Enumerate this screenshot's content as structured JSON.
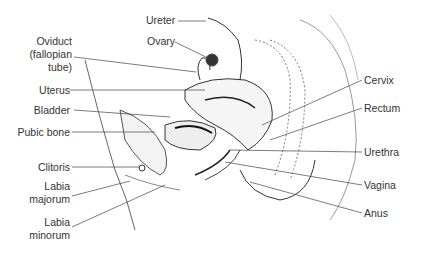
{
  "diagram": {
    "labels_left": [
      {
        "id": "oviduct",
        "text": "Oviduct\n(fallopian\ntube)"
      },
      {
        "id": "uterus",
        "text": "Uterus"
      },
      {
        "id": "bladder",
        "text": "Bladder"
      },
      {
        "id": "pubic-bone",
        "text": "Pubic bone"
      },
      {
        "id": "clitoris",
        "text": "Clitoris"
      },
      {
        "id": "labia-majorum",
        "text": "Labia\nmajorum"
      },
      {
        "id": "labia-minorum",
        "text": "Labia\nminorum"
      }
    ],
    "labels_top": [
      {
        "id": "ureter",
        "text": "Ureter"
      },
      {
        "id": "ovary",
        "text": "Ovary"
      }
    ],
    "labels_right": [
      {
        "id": "cervix",
        "text": "Cervix"
      },
      {
        "id": "rectum",
        "text": "Rectum"
      },
      {
        "id": "urethra",
        "text": "Urethra"
      },
      {
        "id": "vagina",
        "text": "Vagina"
      },
      {
        "id": "anus",
        "text": "Anus"
      }
    ]
  }
}
